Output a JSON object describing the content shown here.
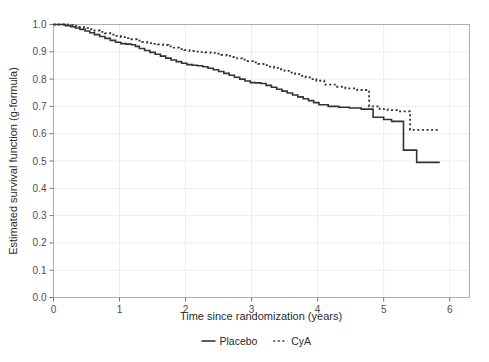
{
  "chart_data": {
    "type": "line",
    "title": "",
    "xlabel": "Time since randomization (years)",
    "ylabel": "Estimated survival function (g-formula)",
    "xlim": [
      0,
      6.3
    ],
    "ylim": [
      0,
      1.0
    ],
    "xticks": [
      0,
      1,
      2,
      3,
      4,
      5,
      6
    ],
    "xtick_labels": [
      "0",
      "1",
      "2",
      "3",
      "4",
      "5",
      "6"
    ],
    "yticks": [
      0.0,
      0.1,
      0.2,
      0.3,
      0.4,
      0.5,
      0.6,
      0.7,
      0.8,
      0.9,
      1.0
    ],
    "ytick_labels": [
      "0.0",
      "0.1",
      "0.2",
      "0.3",
      "0.4",
      "0.5",
      "0.6",
      "0.7",
      "0.8",
      "0.9",
      "1.0"
    ],
    "grid": true,
    "grid_color": "#ededed",
    "panel_border_color": "#b0b0b0",
    "background": "#ffffff",
    "legend_position": "bottom",
    "step_style": "hv",
    "series": [
      {
        "name": "Placebo",
        "label": "Placebo",
        "linestyle": "solid",
        "color": "#333333",
        "linewidth": 1.6,
        "x": [
          0.0,
          0.1,
          0.18,
          0.26,
          0.33,
          0.4,
          0.48,
          0.55,
          0.62,
          0.7,
          0.78,
          0.86,
          0.94,
          1.02,
          1.1,
          1.18,
          1.24,
          1.3,
          1.38,
          1.46,
          1.54,
          1.62,
          1.7,
          1.78,
          1.86,
          1.94,
          2.02,
          2.1,
          2.18,
          2.26,
          2.34,
          2.42,
          2.5,
          2.58,
          2.66,
          2.74,
          2.82,
          2.9,
          2.98,
          3.06,
          3.14,
          3.22,
          3.3,
          3.38,
          3.46,
          3.54,
          3.62,
          3.7,
          3.78,
          3.86,
          3.94,
          4.02,
          4.16,
          4.32,
          4.48,
          4.66,
          4.84,
          5.0,
          5.12,
          5.3,
          5.5,
          5.85
        ],
        "y": [
          1.0,
          1.0,
          0.996,
          0.992,
          0.987,
          0.982,
          0.976,
          0.97,
          0.963,
          0.956,
          0.949,
          0.942,
          0.935,
          0.93,
          0.928,
          0.926,
          0.92,
          0.912,
          0.905,
          0.898,
          0.891,
          0.884,
          0.877,
          0.87,
          0.864,
          0.858,
          0.853,
          0.851,
          0.849,
          0.845,
          0.84,
          0.834,
          0.828,
          0.821,
          0.814,
          0.807,
          0.8,
          0.793,
          0.787,
          0.786,
          0.784,
          0.777,
          0.77,
          0.763,
          0.756,
          0.749,
          0.742,
          0.735,
          0.728,
          0.721,
          0.714,
          0.706,
          0.7,
          0.697,
          0.694,
          0.69,
          0.66,
          0.652,
          0.645,
          0.54,
          0.495,
          0.495
        ]
      },
      {
        "name": "CyA",
        "label": "CyA",
        "linestyle": "dotted",
        "color": "#333333",
        "linewidth": 1.8,
        "x": [
          0.0,
          0.12,
          0.22,
          0.3,
          0.38,
          0.46,
          0.54,
          0.62,
          0.7,
          0.78,
          0.86,
          0.94,
          1.02,
          1.1,
          1.18,
          1.26,
          1.34,
          1.42,
          1.5,
          1.58,
          1.66,
          1.74,
          1.82,
          1.9,
          1.98,
          2.06,
          2.14,
          2.22,
          2.3,
          2.38,
          2.46,
          2.54,
          2.62,
          2.7,
          2.78,
          2.86,
          2.94,
          3.02,
          3.1,
          3.18,
          3.26,
          3.34,
          3.42,
          3.5,
          3.58,
          3.66,
          3.74,
          3.82,
          3.9,
          3.98,
          4.1,
          4.26,
          4.42,
          4.6,
          4.78,
          4.94,
          5.06,
          5.2,
          5.4,
          5.85
        ],
        "y": [
          1.0,
          1.0,
          0.998,
          0.995,
          0.991,
          0.987,
          0.983,
          0.978,
          0.973,
          0.968,
          0.963,
          0.958,
          0.954,
          0.95,
          0.946,
          0.941,
          0.936,
          0.932,
          0.929,
          0.927,
          0.925,
          0.92,
          0.915,
          0.91,
          0.906,
          0.903,
          0.901,
          0.899,
          0.898,
          0.896,
          0.893,
          0.889,
          0.885,
          0.881,
          0.876,
          0.871,
          0.866,
          0.861,
          0.856,
          0.851,
          0.846,
          0.841,
          0.836,
          0.83,
          0.824,
          0.818,
          0.812,
          0.806,
          0.8,
          0.794,
          0.78,
          0.772,
          0.766,
          0.76,
          0.7,
          0.69,
          0.686,
          0.682,
          0.614,
          0.614
        ]
      }
    ]
  },
  "legend": {
    "entries": [
      {
        "label": "Placebo",
        "style": "solid"
      },
      {
        "label": "CyA",
        "style": "dotted"
      }
    ]
  }
}
